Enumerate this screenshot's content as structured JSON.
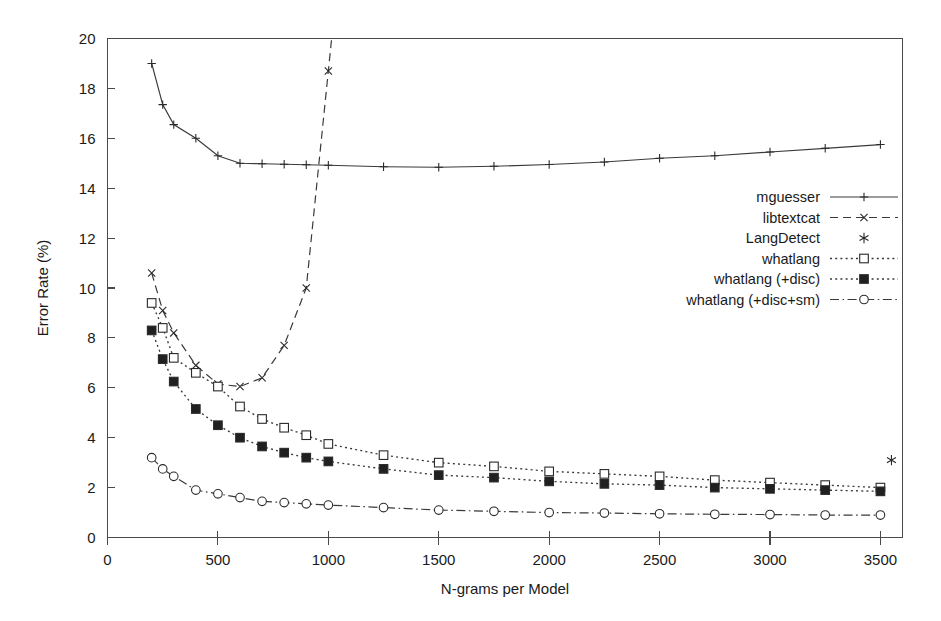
{
  "chart_data": {
    "type": "line",
    "title": "",
    "xlabel": "N-grams per Model",
    "ylabel": "Error Rate (%)",
    "xlim": [
      0,
      3600
    ],
    "ylim": [
      0,
      20
    ],
    "xticks": [
      0,
      500,
      1000,
      1500,
      2000,
      2500,
      3000,
      3500
    ],
    "yticks": [
      0,
      2,
      4,
      6,
      8,
      10,
      12,
      14,
      16,
      18,
      20
    ],
    "grid": false,
    "legend_position": "center-right",
    "frame": "box",
    "series": [
      {
        "name": "mguesser",
        "marker": "plus",
        "linestyle": "solid",
        "color": "#3a3a3a",
        "x": [
          200,
          250,
          300,
          400,
          500,
          600,
          700,
          800,
          900,
          1000,
          1250,
          1500,
          1750,
          2000,
          2250,
          2500,
          2750,
          3000,
          3250,
          3500
        ],
        "y": [
          19.0,
          17.35,
          16.55,
          16.0,
          15.3,
          15.0,
          14.98,
          14.96,
          14.94,
          14.92,
          14.86,
          14.84,
          14.88,
          14.95,
          15.05,
          15.2,
          15.3,
          15.45,
          15.6,
          15.75
        ]
      },
      {
        "name": "libtextcat",
        "marker": "cross",
        "linestyle": "dashed",
        "color": "#3a3a3a",
        "x": [
          200,
          250,
          300,
          400,
          500,
          600,
          700,
          800,
          900,
          1000
        ],
        "y": [
          10.6,
          9.1,
          8.2,
          6.9,
          6.15,
          6.05,
          6.4,
          7.7,
          10.0,
          18.7
        ]
      },
      {
        "name": "LangDetect",
        "marker": "asterisk",
        "linestyle": "none",
        "color": "#2a2a2a",
        "x": [
          3550
        ],
        "y": [
          3.1
        ]
      },
      {
        "name": "whatlang",
        "marker": "open-square",
        "linestyle": "dotted",
        "color": "#3a3a3a",
        "x": [
          200,
          250,
          300,
          400,
          500,
          600,
          700,
          800,
          900,
          1000,
          1250,
          1500,
          1750,
          2000,
          2250,
          2500,
          2750,
          3000,
          3250,
          3500
        ],
        "y": [
          9.4,
          8.4,
          7.2,
          6.6,
          6.05,
          5.25,
          4.75,
          4.4,
          4.1,
          3.75,
          3.3,
          3.0,
          2.85,
          2.65,
          2.55,
          2.45,
          2.3,
          2.2,
          2.1,
          2.0
        ]
      },
      {
        "name": "whatlang (+disc)",
        "marker": "filled-square",
        "linestyle": "dotted",
        "color": "#2a2a2a",
        "x": [
          200,
          250,
          300,
          400,
          500,
          600,
          700,
          800,
          900,
          1000,
          1250,
          1500,
          1750,
          2000,
          2250,
          2500,
          2750,
          3000,
          3250,
          3500
        ],
        "y": [
          8.3,
          7.15,
          6.25,
          5.15,
          4.5,
          4.0,
          3.65,
          3.4,
          3.2,
          3.05,
          2.75,
          2.5,
          2.4,
          2.25,
          2.15,
          2.1,
          2.0,
          1.95,
          1.9,
          1.85
        ]
      },
      {
        "name": "whatlang (+disc+sm)",
        "marker": "open-circle",
        "linestyle": "dashdot",
        "color": "#3a3a3a",
        "x": [
          200,
          250,
          300,
          400,
          500,
          600,
          700,
          800,
          900,
          1000,
          1250,
          1500,
          1750,
          2000,
          2250,
          2500,
          2750,
          3000,
          3250,
          3500
        ],
        "y": [
          3.2,
          2.75,
          2.45,
          1.9,
          1.75,
          1.6,
          1.45,
          1.4,
          1.35,
          1.3,
          1.2,
          1.1,
          1.05,
          1.0,
          0.98,
          0.95,
          0.93,
          0.92,
          0.9,
          0.9
        ]
      }
    ],
    "legend": [
      {
        "label": "mguesser",
        "marker": "plus",
        "linestyle": "solid"
      },
      {
        "label": "libtextcat",
        "marker": "cross",
        "linestyle": "dashed"
      },
      {
        "label": "LangDetect",
        "marker": "asterisk",
        "linestyle": "none"
      },
      {
        "label": "whatlang",
        "marker": "open-square",
        "linestyle": "dotted"
      },
      {
        "label": "whatlang (+disc)",
        "marker": "filled-square",
        "linestyle": "dotted"
      },
      {
        "label": "whatlang (+disc+sm)",
        "marker": "open-circle",
        "linestyle": "dashdot"
      }
    ]
  }
}
